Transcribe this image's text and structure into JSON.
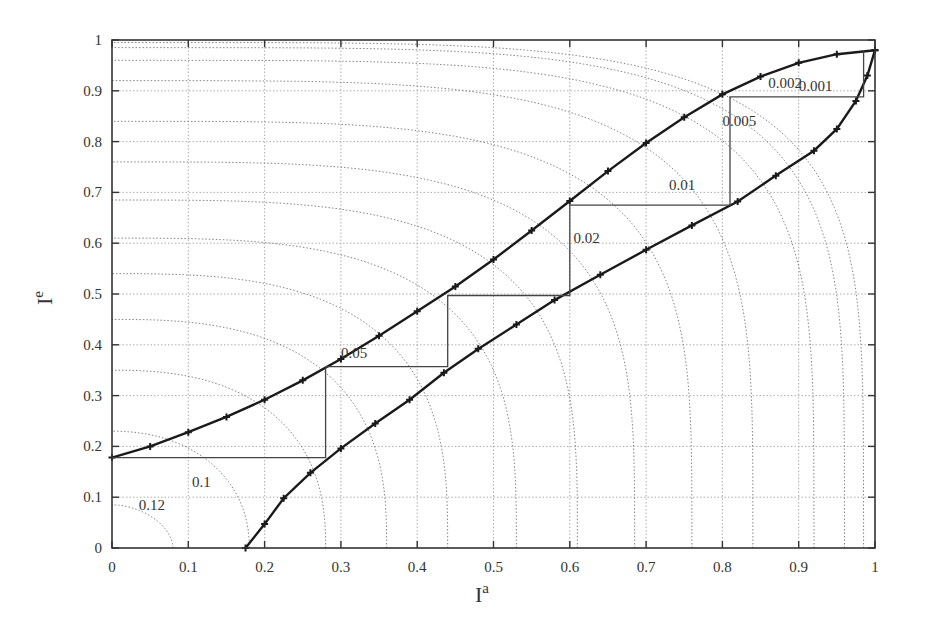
{
  "chart_data": {
    "type": "line",
    "title": "",
    "xlabel": "I^a",
    "ylabel": "I^e",
    "xlim": [
      0,
      1
    ],
    "ylim": [
      0,
      1
    ],
    "grid": true,
    "xticks": [
      "0",
      "0.1",
      "0.2",
      "0.3",
      "0.4",
      "0.5",
      "0.6",
      "0.7",
      "0.8",
      "0.9",
      "1"
    ],
    "yticks": [
      "0",
      "0.1",
      "0.2",
      "0.3",
      "0.4",
      "0.5",
      "0.6",
      "0.7",
      "0.8",
      "0.9",
      "1"
    ],
    "series": [
      {
        "name": "upper-curve",
        "x": [
          0,
          0.05,
          0.1,
          0.15,
          0.2,
          0.25,
          0.3,
          0.35,
          0.4,
          0.45,
          0.5,
          0.55,
          0.6,
          0.65,
          0.7,
          0.75,
          0.8,
          0.85,
          0.9,
          0.95,
          1.0
        ],
        "y": [
          0.178,
          0.2,
          0.228,
          0.258,
          0.292,
          0.33,
          0.372,
          0.418,
          0.466,
          0.515,
          0.568,
          0.625,
          0.683,
          0.742,
          0.797,
          0.848,
          0.893,
          0.928,
          0.955,
          0.972,
          0.98
        ]
      },
      {
        "name": "lower-curve",
        "x": [
          0.175,
          0.2,
          0.225,
          0.26,
          0.3,
          0.345,
          0.39,
          0.435,
          0.48,
          0.53,
          0.58,
          0.64,
          0.7,
          0.76,
          0.82,
          0.87,
          0.92,
          0.95,
          0.975,
          0.99,
          1.0
        ],
        "y": [
          0,
          0.047,
          0.098,
          0.148,
          0.196,
          0.245,
          0.292,
          0.345,
          0.392,
          0.44,
          0.488,
          0.538,
          0.587,
          0.635,
          0.682,
          0.733,
          0.782,
          0.825,
          0.88,
          0.93,
          0.98
        ]
      },
      {
        "name": "staircase",
        "x": [
          0,
          0.28,
          0.28,
          0.44,
          0.44,
          0.6,
          0.6,
          0.81,
          0.81,
          0.985,
          0.985
        ],
        "y": [
          0.178,
          0.178,
          0.357,
          0.357,
          0.497,
          0.497,
          0.675,
          0.675,
          0.888,
          0.888,
          0.98
        ]
      }
    ],
    "contours": {
      "levels": [
        0.12,
        0.1,
        0.05,
        0.02,
        0.01,
        0.005,
        0.002,
        0.001
      ],
      "labels": [
        {
          "text": "0.12",
          "x": 0.035,
          "y": 0.075
        },
        {
          "text": "0.1",
          "x": 0.105,
          "y": 0.12
        },
        {
          "text": "0.05",
          "x": 0.3,
          "y": 0.375
        },
        {
          "text": "0.02",
          "x": 0.605,
          "y": 0.6
        },
        {
          "text": "0.01",
          "x": 0.73,
          "y": 0.705
        },
        {
          "text": "0.005",
          "x": 0.8,
          "y": 0.83
        },
        {
          "text": "0.002",
          "x": 0.86,
          "y": 0.905
        },
        {
          "text": "0.001",
          "x": 0.9,
          "y": 0.9
        }
      ]
    },
    "colors": {
      "curve": "#1a1a1a",
      "staircase": "#444444",
      "grid": "#999999",
      "contour": "#777777"
    }
  }
}
